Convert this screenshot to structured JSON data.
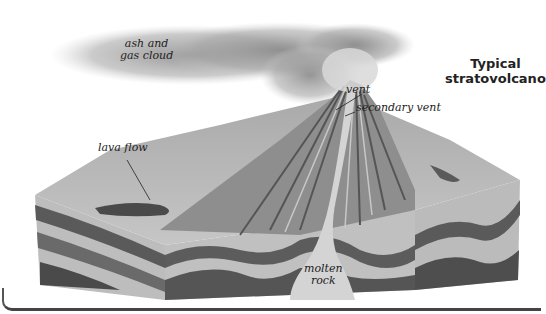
{
  "diagram": {
    "title_line1": "Typical",
    "title_line2": "stratovolcano",
    "labels": {
      "ash_cloud_line1": "ash and",
      "ash_cloud_line2": "gas cloud",
      "vent": "vent",
      "secondary_vent": "secondary vent",
      "lava_flow": "lava flow",
      "molten_line1": "molten",
      "molten_line2": "rock"
    }
  },
  "colors": {
    "background": "#ffffff",
    "text": "#222222",
    "layer_light": "#b8b8b8",
    "layer_dark": "#5a5a5a",
    "border": "#444444"
  }
}
